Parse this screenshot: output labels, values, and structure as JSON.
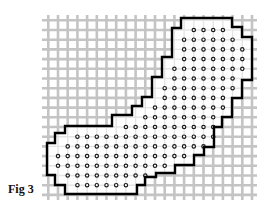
{
  "figure": {
    "label": "Fig 3",
    "colors": {
      "background": "#ffffff",
      "grid": "#c4c4c4",
      "outline": "#000000",
      "dot_stroke": "#1a1a1a",
      "dot_fill": "#ffffff",
      "region_fill": "#ffffff"
    },
    "grid": {
      "origin_x": 58,
      "origin_y": 30,
      "pitch": 9.7,
      "x_min": 42,
      "x_max": 257,
      "y_min": 15,
      "y_max": 200,
      "line_width": 2.6
    },
    "dot_rows": [
      {
        "row": 0,
        "from": 14,
        "to": 17
      },
      {
        "row": 1,
        "from": 13,
        "to": 18
      },
      {
        "row": 2,
        "from": 13,
        "to": 19
      },
      {
        "row": 3,
        "from": 13,
        "to": 19
      },
      {
        "row": 4,
        "from": 12,
        "to": 19
      },
      {
        "row": 5,
        "from": 12,
        "to": 18
      },
      {
        "row": 6,
        "from": 11,
        "to": 18
      },
      {
        "row": 7,
        "from": 11,
        "to": 17
      },
      {
        "row": 8,
        "from": 10,
        "to": 17
      },
      {
        "row": 9,
        "from": 9,
        "to": 16
      },
      {
        "row": 10,
        "from": 7,
        "to": 16
      },
      {
        "row": 11,
        "from": 2,
        "to": 16
      },
      {
        "row": 12,
        "from": 1,
        "to": 15
      },
      {
        "row": 13,
        "from": 0,
        "to": 13
      },
      {
        "row": 14,
        "from": 0,
        "to": 11
      },
      {
        "row": 15,
        "from": 1,
        "to": 9
      },
      {
        "row": 16,
        "from": 2,
        "to": 7
      }
    ],
    "outline_points": [
      [
        181,
        18
      ],
      [
        232,
        18
      ],
      [
        232,
        27
      ],
      [
        242,
        27
      ],
      [
        242,
        37
      ],
      [
        252,
        37
      ],
      [
        252,
        80
      ],
      [
        242,
        80
      ],
      [
        242,
        98
      ],
      [
        232,
        98
      ],
      [
        232,
        117
      ],
      [
        222,
        117
      ],
      [
        222,
        127
      ],
      [
        214,
        127
      ],
      [
        214,
        147
      ],
      [
        204,
        147
      ],
      [
        204,
        155
      ],
      [
        194,
        155
      ],
      [
        194,
        165
      ],
      [
        175,
        165
      ],
      [
        175,
        173
      ],
      [
        156,
        173
      ],
      [
        156,
        177
      ],
      [
        145,
        177
      ],
      [
        145,
        185
      ],
      [
        137,
        185
      ],
      [
        137,
        194
      ],
      [
        65,
        194
      ],
      [
        65,
        185
      ],
      [
        55,
        185
      ],
      [
        55,
        175
      ],
      [
        47,
        175
      ],
      [
        47,
        143
      ],
      [
        55,
        143
      ],
      [
        55,
        133
      ],
      [
        65,
        133
      ],
      [
        65,
        126
      ],
      [
        112,
        126
      ],
      [
        112,
        115
      ],
      [
        132,
        115
      ],
      [
        132,
        106
      ],
      [
        142,
        106
      ],
      [
        142,
        97
      ],
      [
        152,
        97
      ],
      [
        152,
        77
      ],
      [
        162,
        77
      ],
      [
        162,
        57
      ],
      [
        172,
        57
      ],
      [
        172,
        28
      ],
      [
        181,
        28
      ]
    ]
  }
}
